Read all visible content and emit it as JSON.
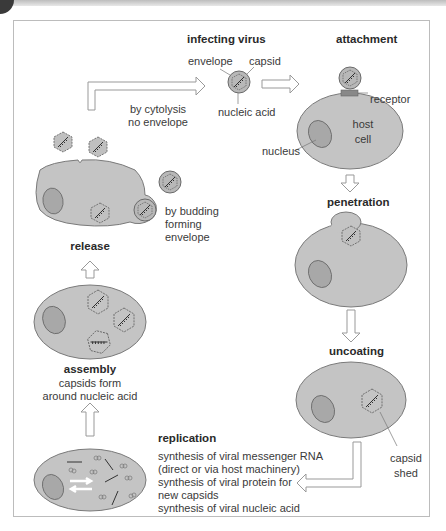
{
  "stages": {
    "infecting_virus": {
      "title": "infecting virus",
      "labels": {
        "envelope": "envelope",
        "capsid": "capsid",
        "nucleic_acid": "nucleic acid"
      }
    },
    "attachment": {
      "title": "attachment",
      "labels": {
        "receptor": "receptor",
        "host_cell_line1": "host",
        "host_cell_line2": "cell",
        "nucleus": "nucleus"
      }
    },
    "penetration": {
      "title": "penetration"
    },
    "uncoating": {
      "title": "uncoating",
      "labels": {
        "capsid_shed_line1": "capsid",
        "capsid_shed_line2": "shed"
      }
    },
    "replication": {
      "title": "replication",
      "lines": [
        "synthesis of viral messenger RNA",
        "(direct or via host machinery)",
        "synthesis of viral protein for",
        "new capsids",
        "synthesis of viral nucleic acid"
      ]
    },
    "assembly": {
      "title": "assembly",
      "lines": [
        "capsids form",
        "around nucleic acid"
      ]
    },
    "release": {
      "title": "release",
      "cytolysis": [
        "by cytolysis",
        "no envelope"
      ],
      "budding": [
        "by budding",
        "forming",
        "envelope"
      ]
    }
  },
  "colors": {
    "cell_fill": "#c4c4c4",
    "cell_stroke": "#7a7a7a",
    "nucleus_fill": "#a8a8a8",
    "virus_fill": "#b8b8b8",
    "text": "#3a3a3a",
    "frame": "#bcbcbc"
  }
}
